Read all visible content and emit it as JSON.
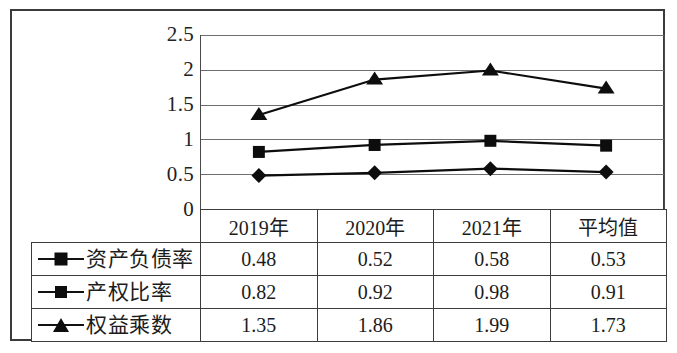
{
  "chart_data": {
    "type": "line",
    "title": "",
    "xlabel": "",
    "ylabel": "",
    "categories": [
      "2019年",
      "2020年",
      "2021年",
      "平均值"
    ],
    "ylim": [
      0,
      2.5
    ],
    "yticks": [
      "2.5",
      "2",
      "1.5",
      "1",
      "0.5",
      "0"
    ],
    "ytick_values": [
      2.5,
      2,
      1.5,
      1,
      0.5,
      0
    ],
    "grid": true,
    "legend_position": "table-left-column",
    "series": [
      {
        "name": "资产负债率",
        "marker": "diamond",
        "color": "#0d0d0d",
        "values": [
          0.48,
          0.52,
          0.58,
          0.53
        ],
        "labels": [
          "0.48",
          "0.52",
          "0.58",
          "0.53"
        ]
      },
      {
        "name": "产权比率",
        "marker": "square",
        "color": "#0d0d0d",
        "values": [
          0.82,
          0.92,
          0.98,
          0.91
        ],
        "labels": [
          "0.82",
          "0.92",
          "0.98",
          "0.91"
        ]
      },
      {
        "name": "权益乘数",
        "marker": "triangle",
        "color": "#0d0d0d",
        "values": [
          1.35,
          1.86,
          1.99,
          1.73
        ],
        "labels": [
          "1.35",
          "1.86",
          "1.99",
          "1.73"
        ]
      }
    ]
  },
  "axis": {
    "y_tick_0": "2.5",
    "y_tick_1": "2",
    "y_tick_2": "1.5",
    "y_tick_3": "1",
    "y_tick_4": "0.5",
    "y_tick_5": "0"
  },
  "table": {
    "header": {
      "legend_cell": "",
      "columns": [
        "2019年",
        "2020年",
        "2021年",
        "平均值"
      ]
    },
    "rows": [
      {
        "marker": "diamond",
        "label": "资产负债率",
        "cells": [
          "0.48",
          "0.52",
          "0.58",
          "0.53"
        ]
      },
      {
        "marker": "square",
        "label": "产权比率",
        "cells": [
          "0.82",
          "0.92",
          "0.98",
          "0.91"
        ]
      },
      {
        "marker": "triangle",
        "label": "权益乘数",
        "cells": [
          "1.35",
          "1.86",
          "1.99",
          "1.73"
        ]
      }
    ]
  },
  "colors": {
    "series_ink": "#0d0d0d",
    "gridline": "#6e6e6e",
    "frame": "#3a3a3a",
    "table_border": "#3c3c3c",
    "background": "#ffffff"
  }
}
